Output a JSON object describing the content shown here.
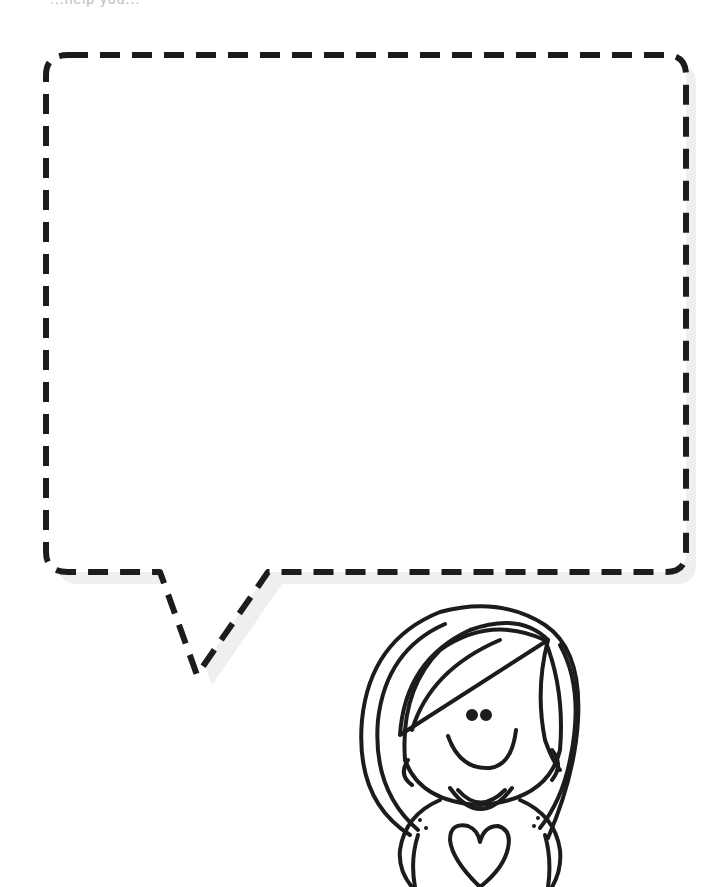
{
  "page": {
    "top_text_fragment": "...help you..."
  },
  "speech_bubble": {
    "content_text": "",
    "stroke_color": "#1c1c1c",
    "shadow_color": "#eeeeee",
    "style": "dashed"
  },
  "character": {
    "description": "girl with bob haircut, smiling, shirt with heart",
    "line_color": "#1c1c1c"
  }
}
